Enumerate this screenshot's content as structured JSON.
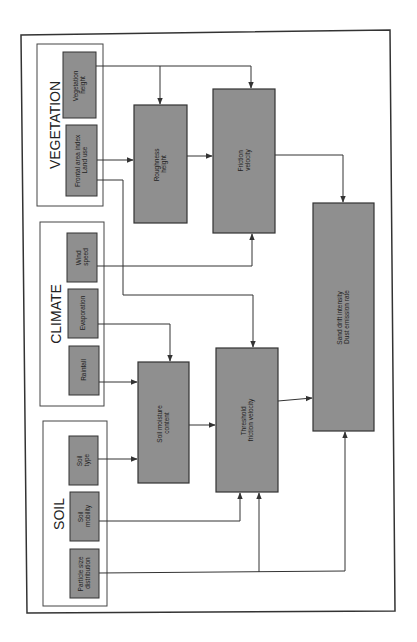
{
  "diagram": {
    "groups": [
      {
        "id": "vegetation",
        "title": "VEGETATION"
      },
      {
        "id": "climate",
        "title": "CLIMATE"
      },
      {
        "id": "soil",
        "title": "SOIL"
      }
    ],
    "inputs": {
      "vegetation_height": {
        "line1": "Vegetation",
        "line2": "height"
      },
      "frontal_area": {
        "line1": "Frontal area index",
        "line2": "Land use"
      },
      "wind_speed": {
        "line1": "Wind",
        "line2": "speed"
      },
      "evaporation": {
        "line1": "Evaporation",
        "line2": ""
      },
      "rainfall": {
        "line1": "Rainfall",
        "line2": ""
      },
      "soil_type": {
        "line1": "Soil",
        "line2": "type"
      },
      "soil_mobility": {
        "line1": "Soil",
        "line2": "mobility"
      },
      "particle_size": {
        "line1": "Particle size",
        "line2": "distribution"
      }
    },
    "processes": {
      "roughness_height": {
        "line1": "Roughness",
        "line2": "height"
      },
      "friction_velocity": {
        "line1": "Friction",
        "line2": "velocity"
      },
      "soil_moisture": {
        "line1": "Soil moisture",
        "line2": "content"
      },
      "threshold_friction": {
        "line1": "Threshold",
        "line2": "friction velocity"
      },
      "sand_drift": {
        "line1": "Sand drift intensity",
        "line2": "Dust emission rate"
      }
    },
    "colors": {
      "box_fill": "#8f8f8f",
      "box_stroke": "#333333",
      "line": "#333333",
      "background": "#ffffff"
    }
  }
}
